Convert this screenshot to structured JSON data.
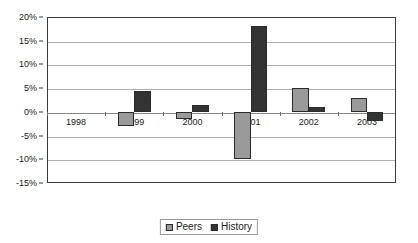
{
  "chart_data": {
    "type": "bar",
    "title": "",
    "xlabel": "",
    "ylabel": "",
    "categories": [
      "1998",
      "1999",
      "2000",
      "2001",
      "2002",
      "2003"
    ],
    "series": [
      {
        "name": "Peers",
        "color": "#9a9a9a",
        "values": [
          0,
          -3,
          -1.5,
          -10,
          5,
          3
        ]
      },
      {
        "name": "History",
        "color": "#333333",
        "values": [
          0,
          4.5,
          1.5,
          18,
          1,
          -2
        ]
      }
    ],
    "ylim": [
      -15,
      20
    ],
    "ytick_values": [
      20,
      15,
      10,
      5,
      0,
      -5,
      -10,
      -15
    ],
    "ytick_labels": [
      "20%",
      "15%",
      "10%",
      "5%",
      "0%",
      "-5%",
      "-10%",
      "-15%"
    ],
    "grid": true,
    "legend_position": "bottom"
  }
}
